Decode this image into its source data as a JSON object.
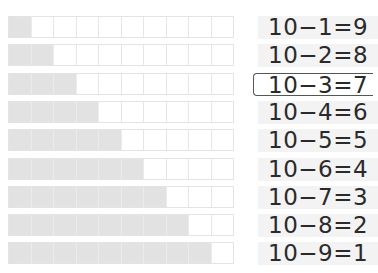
{
  "grid": {
    "cells_per_row": 10,
    "filled_color": "#e2e2e2",
    "empty_color": "#ffffff",
    "rows": [
      {
        "filled": 1
      },
      {
        "filled": 2
      },
      {
        "filled": 3
      },
      {
        "filled": 4
      },
      {
        "filled": 5
      },
      {
        "filled": 6
      },
      {
        "filled": 7
      },
      {
        "filled": 8
      },
      {
        "filled": 9
      }
    ]
  },
  "equations": [
    {
      "text": "10−1=9",
      "highlighted": false
    },
    {
      "text": "10−2=8",
      "highlighted": false
    },
    {
      "text": "10−3=7",
      "highlighted": true
    },
    {
      "text": "10−4=6",
      "highlighted": false
    },
    {
      "text": "10−5=5",
      "highlighted": false
    },
    {
      "text": "10−6=4",
      "highlighted": false
    },
    {
      "text": "10−7=3",
      "highlighted": false
    },
    {
      "text": "10−8=2",
      "highlighted": false
    },
    {
      "text": "10−9=1",
      "highlighted": false
    }
  ]
}
